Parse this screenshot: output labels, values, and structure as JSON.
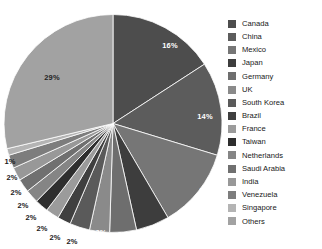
{
  "chart_data": {
    "type": "pie",
    "title": "",
    "subtitle": "",
    "xlabel": "",
    "ylabel": "",
    "legend_position": "right",
    "grid": false,
    "value_unit": "%",
    "categories": [
      "Canada",
      "China",
      "Mexico",
      "Japan",
      "Germany",
      "UK",
      "South Korea",
      "Brazil",
      "France",
      "Taiwan",
      "Netherlands",
      "Saudi Arabia",
      "India",
      "Venezuela",
      "Singapore",
      "Others"
    ],
    "values": [
      16,
      14,
      12,
      5,
      4,
      3,
      3,
      2,
      2,
      2,
      2,
      2,
      2,
      2,
      1,
      29
    ],
    "labels": [
      "16%",
      "14%",
      "12%",
      "5%",
      "4%",
      "3%",
      "3%",
      "2%",
      "2%",
      "2%",
      "2%",
      "2%",
      "2%",
      "2%",
      "1%",
      "29%"
    ],
    "colors": [
      "#4d4d4d",
      "#5c5c5c",
      "#767676",
      "#3d3d3d",
      "#6e6e6e",
      "#8a8a8a",
      "#5a5a5a",
      "#3f3f3f",
      "#9b9b9b",
      "#2e2e2e",
      "#858585",
      "#707070",
      "#989898",
      "#7d7d7d",
      "#b4b4b4",
      "#a2a2a2"
    ],
    "slices": [
      {
        "name": "Canada",
        "value": 16,
        "label": "16%",
        "color": "#4d4d4d",
        "label_x": 170,
        "label_y": 45,
        "label_style": "inside"
      },
      {
        "name": "China",
        "value": 14,
        "label": "14%",
        "color": "#5c5c5c",
        "label_x": 205,
        "label_y": 116,
        "label_style": "inside"
      },
      {
        "name": "Mexico",
        "value": 12,
        "label": "12%",
        "color": "#767676",
        "label_x": 207,
        "label_y": 190,
        "label_style": "inside"
      },
      {
        "name": "Japan",
        "value": 5,
        "label": "5%",
        "color": "#3d3d3d",
        "label_x": 170,
        "label_y": 228,
        "label_style": "inside"
      },
      {
        "name": "Germany",
        "value": 4,
        "label": "4%",
        "color": "#6e6e6e",
        "label_x": 145,
        "label_y": 232,
        "label_style": "inside"
      },
      {
        "name": "UK",
        "value": 3,
        "label": "3%",
        "color": "#8a8a8a",
        "label_x": 123,
        "label_y": 234,
        "label_style": "inside"
      },
      {
        "name": "South Korea",
        "value": 3,
        "label": "3%",
        "color": "#5a5a5a",
        "label_x": 101,
        "label_y": 232,
        "label_style": "inside"
      },
      {
        "name": "Brazil",
        "value": 2,
        "label": "2%",
        "color": "#3f3f3f",
        "label_x": 72,
        "label_y": 241,
        "label_style": "outside"
      },
      {
        "name": "France",
        "value": 2,
        "label": "2%",
        "color": "#9b9b9b",
        "label_x": 55,
        "label_y": 237,
        "label_style": "outside"
      },
      {
        "name": "Taiwan",
        "value": 2,
        "label": "2%",
        "color": "#2e2e2e",
        "label_x": 42,
        "label_y": 228,
        "label_style": "outside"
      },
      {
        "name": "Netherlands",
        "value": 2,
        "label": "2%",
        "color": "#858585",
        "label_x": 31,
        "label_y": 217,
        "label_style": "outside"
      },
      {
        "name": "Saudi Arabia",
        "value": 2,
        "label": "2%",
        "color": "#707070",
        "label_x": 23,
        "label_y": 205,
        "label_style": "outside"
      },
      {
        "name": "India",
        "value": 2,
        "label": "2%",
        "color": "#989898",
        "label_x": 16,
        "label_y": 192,
        "label_style": "outside"
      },
      {
        "name": "Venezuela",
        "value": 2,
        "label": "2%",
        "color": "#7d7d7d",
        "label_x": 12,
        "label_y": 177,
        "label_style": "outside"
      },
      {
        "name": "Singapore",
        "value": 1,
        "label": "1%",
        "color": "#b4b4b4",
        "label_x": 10,
        "label_y": 161,
        "label_style": "outside"
      },
      {
        "name": "Others",
        "value": 29,
        "label": "29%",
        "color": "#a2a2a2",
        "label_x": 52,
        "label_y": 77,
        "label_style": "dark-on-light"
      }
    ]
  },
  "legend": {
    "items": [
      {
        "label": "Canada",
        "color": "#4d4d4d"
      },
      {
        "label": "China",
        "color": "#5c5c5c"
      },
      {
        "label": "Mexico",
        "color": "#767676"
      },
      {
        "label": "Japan",
        "color": "#3d3d3d"
      },
      {
        "label": "Germany",
        "color": "#6e6e6e"
      },
      {
        "label": "UK",
        "color": "#8a8a8a"
      },
      {
        "label": "South Korea",
        "color": "#5a5a5a"
      },
      {
        "label": "Brazil",
        "color": "#3f3f3f"
      },
      {
        "label": "France",
        "color": "#9b9b9b"
      },
      {
        "label": "Taiwan",
        "color": "#2e2e2e"
      },
      {
        "label": "Netherlands",
        "color": "#858585"
      },
      {
        "label": "Saudi Arabia",
        "color": "#707070"
      },
      {
        "label": "India",
        "color": "#989898"
      },
      {
        "label": "Venezuela",
        "color": "#7d7d7d"
      },
      {
        "label": "Singapore",
        "color": "#b4b4b4"
      },
      {
        "label": "Others",
        "color": "#a2a2a2"
      }
    ]
  }
}
